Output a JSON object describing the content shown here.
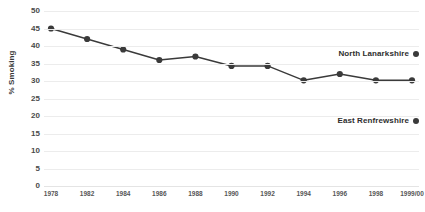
{
  "chart_data": {
    "type": "line",
    "title": "",
    "xlabel": "",
    "ylabel": "% Smoking",
    "ylim": [
      0,
      50
    ],
    "yticks": [
      0,
      5,
      10,
      15,
      20,
      25,
      30,
      35,
      40,
      45,
      50
    ],
    "grid": "horizontal",
    "legend_position": "right-inside",
    "categories": [
      "1978",
      "1982",
      "1984",
      "1986",
      "1988",
      "1990",
      "1992",
      "1994",
      "1996",
      "1998",
      "1999/00"
    ],
    "series": [
      {
        "name": "North Lanarkshire",
        "values": [
          45,
          42,
          39,
          36,
          37,
          34.3,
          34.3,
          30.2,
          32,
          30.2,
          30.2
        ]
      }
    ],
    "annotations": [
      {
        "label": "North Lanarkshire",
        "marker": "filled-circle"
      },
      {
        "label": "East Renfrewshire",
        "marker": "filled-circle"
      }
    ]
  },
  "axes": {
    "y_title": "% Smoking",
    "y_tick_labels": [
      "50",
      "45",
      "40",
      "35",
      "30",
      "25",
      "20",
      "15",
      "10",
      "5",
      "0"
    ],
    "x_tick_labels": [
      "1978",
      "1982",
      "1984",
      "1986",
      "1988",
      "1990",
      "1992",
      "1994",
      "1996",
      "1998",
      "1999/00"
    ]
  },
  "legend": {
    "items": [
      {
        "label": "North Lanarkshire",
        "color": "#3a3a3a",
        "marker_name": "filled-circle-marker"
      },
      {
        "label": "East Renfrewshire",
        "color": "#3a3a3a",
        "marker_name": "filled-circle-marker"
      }
    ]
  },
  "colors": {
    "series_line": "#3a3a3a",
    "marker": "#3a3a3a",
    "gridline": "#ececec",
    "text": "#3a3a3a",
    "background": "#ffffff"
  }
}
